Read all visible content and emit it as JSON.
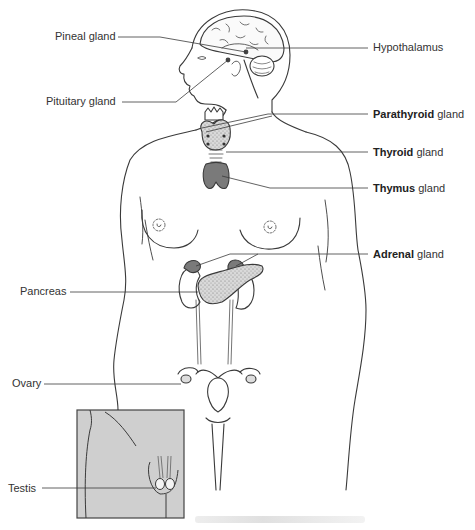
{
  "figure": {
    "type": "anatomical-diagram"
  },
  "labels_left": [
    {
      "id": "pineal",
      "text": "Pineal gland",
      "x": 55,
      "y": 30
    },
    {
      "id": "pituitary",
      "text": "Pituitary gland",
      "x": 46,
      "y": 95
    },
    {
      "id": "pancreas",
      "text": "Pancreas",
      "x": 20,
      "y": 285
    },
    {
      "id": "ovary",
      "text": "Ovary",
      "x": 12,
      "y": 377
    },
    {
      "id": "testis",
      "text": "Testis",
      "x": 8,
      "y": 482
    }
  ],
  "labels_right": [
    {
      "id": "hypothalamus",
      "bold": "",
      "rest": "Hypothalamus",
      "x": 373,
      "y": 41
    },
    {
      "id": "parathyroid",
      "bold": "Parathyroid",
      "rest": " gland",
      "x": 373,
      "y": 108
    },
    {
      "id": "thyroid",
      "bold": "Thyroid",
      "rest": " gland",
      "x": 373,
      "y": 146
    },
    {
      "id": "thymus",
      "bold": "Thymus",
      "rest": " gland",
      "x": 373,
      "y": 182
    },
    {
      "id": "adrenal",
      "bold": "Adrenal",
      "rest": " gland",
      "x": 373,
      "y": 248
    }
  ],
  "colors": {
    "line": "#3a3a3a",
    "gland_dark": "#7a7a7a",
    "gland_stipple": "#c9c9c9",
    "inset_bg": "#cfcfcf"
  }
}
